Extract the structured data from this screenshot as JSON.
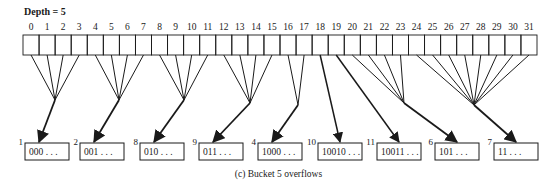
{
  "directory": {
    "depth_label": "Depth = 5",
    "depth": 5,
    "cell_count": 32,
    "indices": [
      "0",
      "1",
      "2",
      "3",
      "4",
      "5",
      "6",
      "7",
      "8",
      "9",
      "10",
      "11",
      "12",
      "13",
      "14",
      "15",
      "16",
      "17",
      "18",
      "19",
      "20",
      "21",
      "22",
      "23",
      "24",
      "25",
      "26",
      "27",
      "28",
      "29",
      "30",
      "31"
    ]
  },
  "buckets": [
    {
      "id": "1",
      "label": "000 . . .",
      "cells": [
        0,
        1,
        2,
        3
      ]
    },
    {
      "id": "2",
      "label": "001 . . .",
      "cells": [
        4,
        5,
        6,
        7
      ]
    },
    {
      "id": "8",
      "label": "010 . . .",
      "cells": [
        8,
        9,
        10,
        11
      ]
    },
    {
      "id": "9",
      "label": "011 . . .",
      "cells": [
        12,
        13,
        14,
        15
      ]
    },
    {
      "id": "4",
      "label": "1000 . . .",
      "cells": [
        16,
        17
      ]
    },
    {
      "id": "10",
      "label": "10010 . . .",
      "cells": [
        18
      ]
    },
    {
      "id": "11",
      "label": "10011 . . .",
      "cells": [
        19
      ]
    },
    {
      "id": "6",
      "label": "101 . . .",
      "cells": [
        20,
        21,
        22,
        23
      ]
    },
    {
      "id": "7",
      "label": "11 . . .",
      "cells": [
        24,
        25,
        26,
        27,
        28,
        29,
        30,
        31
      ]
    }
  ],
  "caption": "(c)  Bucket 5 overflows",
  "colors": {
    "line": "#1a1a1a",
    "background": "#ffffff"
  }
}
